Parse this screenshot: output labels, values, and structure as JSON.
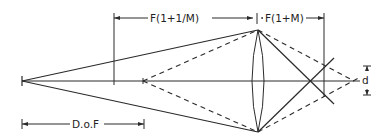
{
  "diagram": {
    "labels": {
      "object_distance": "F(1+1/M)",
      "image_distance": "F(1+M)",
      "depth_of_field": "D.o.F",
      "blur_diameter": "d"
    },
    "colors": {
      "line": "#2a2a2a",
      "background": "#ffffff"
    }
  }
}
